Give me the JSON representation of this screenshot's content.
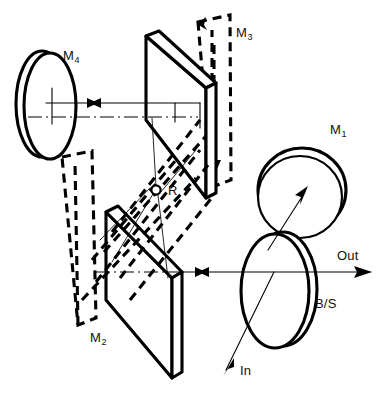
{
  "figure": {
    "type": "optical-ray-diagram",
    "background_color": "#ffffff",
    "line_color": "#000000",
    "width": 386,
    "height": 397
  },
  "labels": {
    "m1": {
      "text": "M",
      "subscript": "1",
      "x": 330,
      "y": 122
    },
    "m2": {
      "text": "M",
      "subscript": "2",
      "x": 90,
      "y": 336
    },
    "m3": {
      "text": "M",
      "subscript": "3",
      "x": 236,
      "y": 25
    },
    "m4": {
      "text": "M",
      "subscript": "4",
      "x": 63,
      "y": 48
    },
    "r": {
      "text": "R",
      "x": 168,
      "y": 192
    },
    "out": {
      "text": "Out",
      "x": 337,
      "y": 248
    },
    "bs": {
      "text": "B/S",
      "x": 315,
      "y": 297
    },
    "in": {
      "text": "In",
      "x": 238,
      "y": 364
    }
  },
  "components": [
    {
      "name": "mirror-m1",
      "kind": "circular-mirror",
      "style": "solid",
      "description": "round mirror seen nearly face-on, upper right",
      "cx": 305,
      "cy": 196,
      "r": 44
    },
    {
      "name": "mirror-m2",
      "kind": "flat-plate-mirror",
      "style": "solid",
      "description": "lower folding plate, bottom centre-left"
    },
    {
      "name": "mirror-m2-alternate",
      "kind": "flat-plate-mirror",
      "style": "dashed",
      "description": "displaced / rotated position of M2 drawn dashed, left side"
    },
    {
      "name": "mirror-m3",
      "kind": "flat-plate-mirror",
      "style": "solid",
      "description": "upper folding plate, top centre"
    },
    {
      "name": "mirror-m3-alternate",
      "kind": "flat-plate-mirror",
      "style": "dashed",
      "description": "displaced / rotated position of M3 drawn dashed, top right"
    },
    {
      "name": "mirror-m4",
      "kind": "elliptical-mirror",
      "style": "solid",
      "description": "tilted round mirror seen obliquely, upper left",
      "cx": 46,
      "cy": 105,
      "rx": 27,
      "ry": 53
    },
    {
      "name": "beam-splitter",
      "kind": "elliptical-plate",
      "style": "solid",
      "description": "beam splitter ellipse, lower right",
      "cx": 277,
      "cy": 290,
      "rx": 35,
      "ry": 57
    },
    {
      "name": "rotation-point-r",
      "kind": "pivot-marker",
      "style": "small-open-circle",
      "cx": 156,
      "cy": 190,
      "r": 4.5
    }
  ],
  "beams": [
    {
      "name": "upper-beam",
      "kind": "solid-ray",
      "direction": "bidirectional",
      "from": [
        46,
        104
      ],
      "to": [
        198,
        104
      ],
      "arrows": "double-head-midpoint"
    },
    {
      "name": "upper-axis",
      "kind": "dash-dot-axis",
      "from": [
        30,
        118
      ],
      "to": [
        200,
        118
      ]
    },
    {
      "name": "lower-beam",
      "kind": "solid-ray",
      "direction": "bidirectional",
      "from": [
        168,
        272
      ],
      "to": [
        372,
        272
      ],
      "arrows": "double-head-midpoint-and-right-tip"
    },
    {
      "name": "lower-axis",
      "kind": "dash-dot-axis",
      "from": [
        95,
        272
      ],
      "to": [
        168,
        272
      ]
    },
    {
      "name": "output-beam",
      "kind": "solid-ray",
      "direction": "right",
      "from": [
        277,
        272
      ],
      "to": [
        372,
        272
      ],
      "label": "Out"
    },
    {
      "name": "input-beam",
      "kind": "solid-ray",
      "direction": "down-left",
      "from": [
        288,
        276
      ],
      "to": [
        224,
        371
      ],
      "label": "In"
    },
    {
      "name": "m1-feed-beam",
      "kind": "solid-ray",
      "direction": "up-right",
      "from": [
        272,
        250
      ],
      "to": [
        304,
        196
      ]
    },
    {
      "name": "internal-ray-m3",
      "kind": "dashed-ray",
      "direction": "down",
      "description": "dashed ray descending through M3 alternate plate"
    },
    {
      "name": "internal-ray-m2",
      "kind": "dashed-ray",
      "direction": "down-left",
      "description": "dashed ray toward M2 alternate plate"
    }
  ],
  "notes": {
    "dashed_meaning": "dashed outlines show the displaced (rotated) positions of mirrors M2 and M3",
    "pivot_meaning": "R marks the common rotation point of the folding mirrors"
  }
}
